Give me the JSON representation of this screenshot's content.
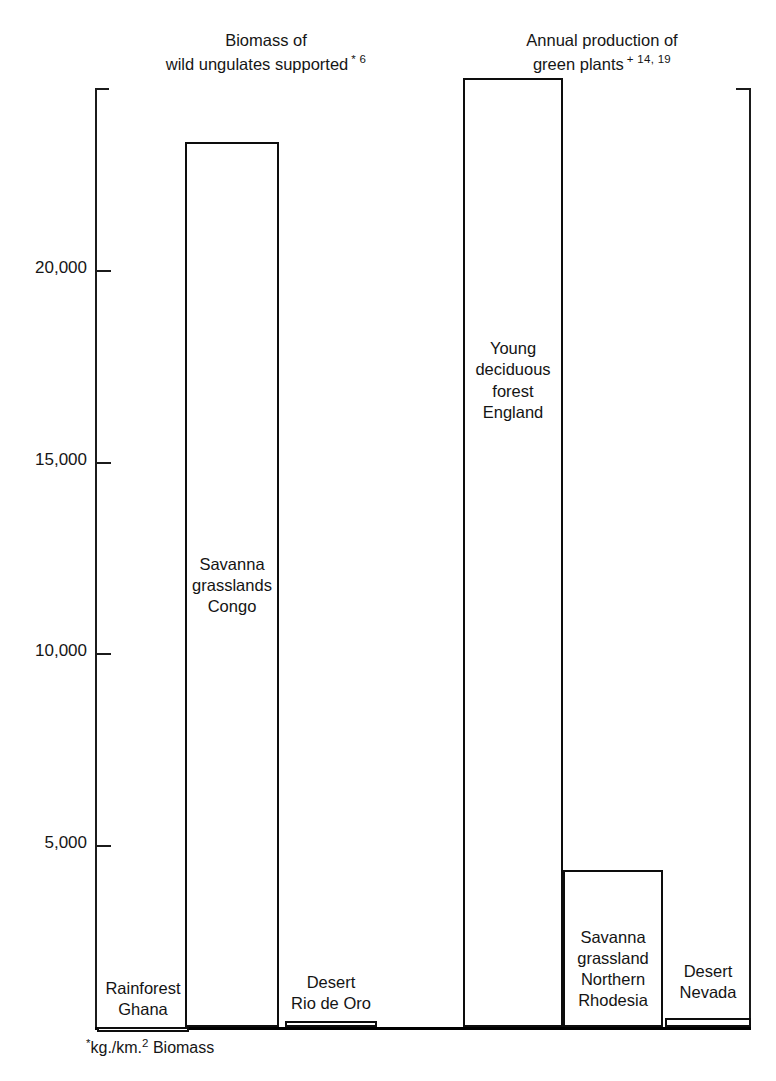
{
  "figure": {
    "footnote_marker": "*",
    "footnote_text_a": "kg./km.",
    "footnote_sq": "2",
    "footnote_text_b": " Biomass"
  },
  "panels": [
    {
      "id": "biomass",
      "title_line1": "Biomass of",
      "title_line2": "wild ungulates supported",
      "reference": "* 6"
    },
    {
      "id": "production",
      "title_line1": "Annual production of",
      "title_line2": "green plants",
      "reference": "+ 14, 19"
    }
  ],
  "axis": {
    "tick_labels": [
      "20,000",
      "15,000",
      "10,000",
      "5,000"
    ],
    "tick_values": [
      20000,
      15000,
      10000,
      5000
    ]
  },
  "bars": [
    {
      "label_line1": "Rainforest",
      "label_line2": "Ghana",
      "label_line3": "",
      "label_line4": "",
      "value": 250
    },
    {
      "label_line1": "Savanna",
      "label_line2": "grasslands",
      "label_line3": "Congo",
      "label_line4": "",
      "value": 23350
    },
    {
      "label_line1": "Desert",
      "label_line2": "Rio de Oro",
      "label_line3": "",
      "label_line4": "",
      "value": 400
    },
    {
      "label_line1": "Young",
      "label_line2": "deciduous",
      "label_line3": "forest",
      "label_line4": "England",
      "value": 25000
    },
    {
      "label_line1": "Savanna",
      "label_line2": "grassland",
      "label_line3": "Northern",
      "label_line4": "Rhodesia",
      "value": 4350
    },
    {
      "label_line1": "Desert",
      "label_line2": "Nevada",
      "label_line3": "",
      "label_line4": "",
      "value": 500
    }
  ],
  "chart_data": {
    "type": "bar",
    "xlabel": "",
    "ylabel": "kg./km.2 Biomass",
    "ylim": [
      0,
      27000
    ],
    "yticks": [
      5000,
      10000,
      15000,
      20000
    ],
    "ytick_labels": [
      "5,000",
      "10,000",
      "15,000",
      "20,000"
    ],
    "grid": false,
    "legend": "none",
    "groups": [
      {
        "name": "Biomass of wild ungulates supported",
        "reference": "* 6",
        "categories": [
          "Rainforest Ghana",
          "Savanna grasslands Congo",
          "Desert Rio de Oro"
        ],
        "values": [
          250,
          23350,
          400
        ]
      },
      {
        "name": "Annual production of green plants",
        "reference": "+ 14, 19",
        "categories": [
          "Young deciduous forest England",
          "Savanna grassland Northern Rhodesia",
          "Desert Nevada"
        ],
        "values": [
          25000,
          4350,
          500
        ]
      }
    ],
    "categories": [
      "Rainforest Ghana",
      "Savanna grasslands Congo",
      "Desert Rio de Oro",
      "Young deciduous forest England",
      "Savanna grassland Northern Rhodesia",
      "Desert Nevada"
    ],
    "values": [
      250,
      23350,
      400,
      25000,
      4350,
      500
    ],
    "annotations": [
      "*kg./km.2 Biomass"
    ]
  }
}
